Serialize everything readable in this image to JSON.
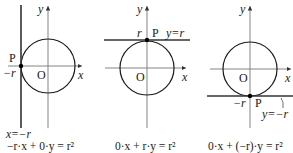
{
  "figure": {
    "panels": [
      {
        "id": "left",
        "axis_labels": {
          "x": "x",
          "y": "y",
          "origin": "O"
        },
        "point_label": "P",
        "intercept_label": "−r",
        "tangent_label": "x=−r",
        "equation": "−r·x + 0·y = r²"
      },
      {
        "id": "top",
        "axis_labels": {
          "x": "x",
          "y": "y",
          "origin": "O"
        },
        "point_label": "P",
        "intercept_label": "r",
        "tangent_label": "y=r",
        "equation": "0·x + r·y = r²"
      },
      {
        "id": "bottom",
        "axis_labels": {
          "x": "x",
          "y": "y",
          "origin": "O"
        },
        "point_label": "P",
        "intercept_label": "−r",
        "tangent_label": "y=−r",
        "equation": "0·x + (−r)·y = r²"
      }
    ],
    "colors": {
      "ink": "#1a1a1a",
      "axis": "#777777",
      "tangent": "#333333"
    }
  }
}
